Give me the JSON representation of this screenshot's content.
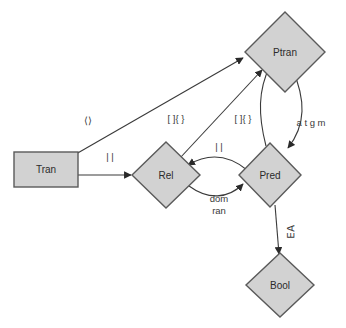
{
  "diagram": {
    "title": "",
    "background_color": "#ffffff",
    "node_fill_color": "#d2d2d2",
    "node_stroke_color": "#5a5a5a",
    "edge_color": "#3a3a3a",
    "label_color": "#2b2b2b",
    "nodes": [
      {
        "id": "tran",
        "label": "Tran",
        "shape": "rectangle",
        "cx": 46,
        "cy": 169
      },
      {
        "id": "rel",
        "label": "Rel",
        "shape": "diamond",
        "cx": 166,
        "cy": 175
      },
      {
        "id": "pred",
        "label": "Pred",
        "shape": "diamond",
        "cx": 270,
        "cy": 175
      },
      {
        "id": "ptran",
        "label": "Ptran",
        "shape": "diamond",
        "cx": 285,
        "cy": 52
      },
      {
        "id": "bool",
        "label": "Bool",
        "shape": "diamond",
        "cx": 280,
        "cy": 285
      }
    ],
    "edges": [
      {
        "id": "tran-ptran",
        "from": "tran",
        "to": "ptran",
        "label": "⟨⟩",
        "label_x": 88,
        "label_y": 121,
        "style": "straight"
      },
      {
        "id": "tran-rel",
        "from": "tran",
        "to": "rel",
        "label": "| |",
        "label_x": 110,
        "label_y": 158,
        "style": "straight"
      },
      {
        "id": "rel-ptran",
        "from": "rel",
        "to": "ptran",
        "label": "[ ]{ }",
        "label_x": 176,
        "label_y": 119,
        "style": "straight"
      },
      {
        "id": "pred-ptran",
        "from": "pred",
        "to": "ptran",
        "label": "[ ]{ }",
        "label_x": 243,
        "label_y": 119,
        "style": "straight"
      },
      {
        "id": "ptran-pred",
        "from": "ptran",
        "to": "pred",
        "label": "a t g m",
        "label_x": 310,
        "label_y": 123,
        "style": "curve-pair"
      },
      {
        "id": "pred-rel",
        "from": "pred",
        "to": "rel",
        "label": "| |",
        "label_x": 218,
        "label_y": 150,
        "style": "curve-up"
      },
      {
        "id": "rel-pred",
        "from": "rel",
        "to": "pred",
        "label": "dom\nran",
        "label_x": 218,
        "label_y": 199,
        "style": "curve-down"
      },
      {
        "id": "pred-bool",
        "from": "pred",
        "to": "bool",
        "label": "∀∃",
        "label_x": 288,
        "label_y": 232,
        "style": "straight-vertical",
        "label_rotated": true
      }
    ],
    "edge_labels": {
      "angle_brackets": "⟨⟩",
      "double_bar_1": "| |",
      "double_bar_2": "| |",
      "bracket_brace_1": "[ ]{ }",
      "bracket_brace_2": "[ ]{ }",
      "atgm": "a t g m",
      "dom": "dom",
      "ran": "ran",
      "quantifiers": "∀∃"
    }
  }
}
